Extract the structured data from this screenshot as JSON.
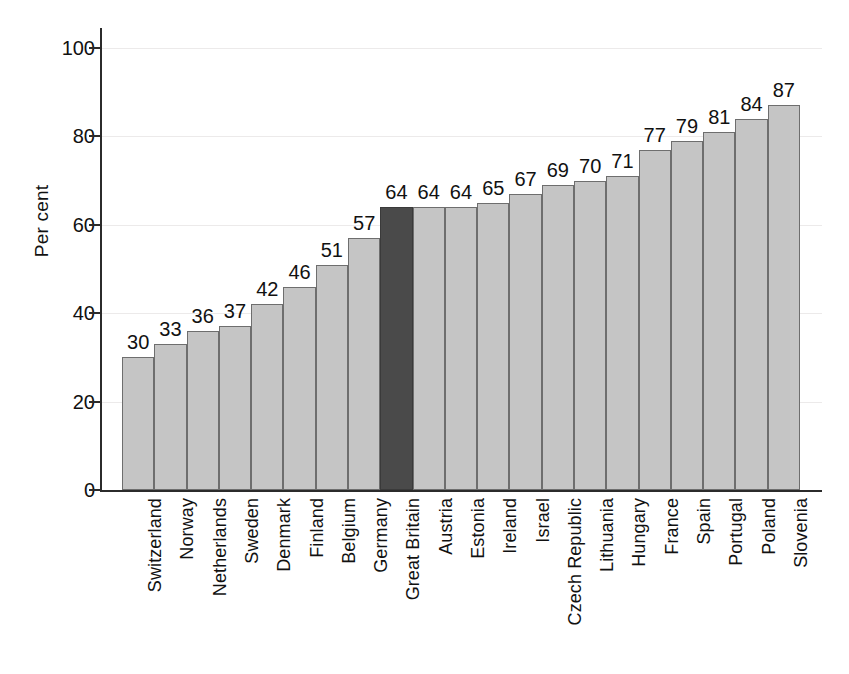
{
  "chart_data": {
    "type": "bar",
    "title": "",
    "subtitle": "",
    "xlabel": "",
    "ylabel": "Per cent",
    "ylim": [
      0,
      100
    ],
    "yticks": [
      0,
      20,
      40,
      60,
      80,
      100
    ],
    "ytick_labels": [
      "0",
      "20",
      "40",
      "60",
      "80",
      "100"
    ],
    "grid": "horizontal",
    "legend": "none",
    "bar_color": "#c5c5c5",
    "highlight_color": "#4a4a4a",
    "highlight_category": "Great Britain",
    "categories": [
      "Switzerland",
      "Norway",
      "Netherlands",
      "Sweden",
      "Denmark",
      "Finland",
      "Belgium",
      "Germany",
      "Great Britain",
      "Austria",
      "Estonia",
      "Ireland",
      "Israel",
      "Czech Republic",
      "Lithuania",
      "Hungary",
      "France",
      "Spain",
      "Portugal",
      "Poland",
      "Slovenia"
    ],
    "values": [
      30,
      33,
      36,
      37,
      42,
      46,
      51,
      57,
      64,
      64,
      64,
      65,
      67,
      69,
      70,
      71,
      77,
      79,
      81,
      84,
      87
    ],
    "value_labels": [
      "30",
      "33",
      "36",
      "37",
      "42",
      "46",
      "51",
      "57",
      "64",
      "64",
      "64",
      "65",
      "67",
      "69",
      "70",
      "71",
      "77",
      "79",
      "81",
      "84",
      "87"
    ],
    "highlighted": [
      false,
      false,
      false,
      false,
      false,
      false,
      false,
      false,
      true,
      false,
      false,
      false,
      false,
      false,
      false,
      false,
      false,
      false,
      false,
      false,
      false
    ]
  }
}
